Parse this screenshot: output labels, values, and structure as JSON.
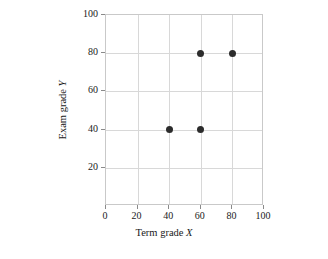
{
  "chart_data": {
    "type": "scatter",
    "title": "",
    "xlabel_prefix": "Term grade ",
    "xlabel_var": "X",
    "ylabel_prefix": "Exam grade ",
    "ylabel_var": "Y",
    "xlim": [
      0,
      100
    ],
    "ylim": [
      0,
      100
    ],
    "xticks": [
      0,
      20,
      40,
      60,
      80,
      100
    ],
    "xtick_labels": [
      "0",
      "20",
      "40",
      "60",
      "80",
      "100"
    ],
    "yticks": [
      20,
      40,
      60,
      80,
      100
    ],
    "ytick_labels": [
      "20",
      "40",
      "60",
      "80",
      "100"
    ],
    "grid": true,
    "legend": false,
    "marker_color": "#2c2c2c",
    "grid_color": "#d8d8d8",
    "axis_color": "#c9c9c9",
    "background": "#ffffff",
    "points": [
      {
        "x": 40,
        "y": 40
      },
      {
        "x": 60,
        "y": 40
      },
      {
        "x": 60,
        "y": 80
      },
      {
        "x": 80,
        "y": 80
      }
    ]
  }
}
